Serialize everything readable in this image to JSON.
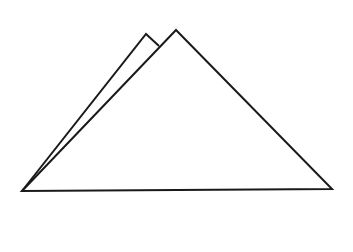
{
  "diagram": {
    "background": "#ffffff",
    "stroke_color": "#1a1a1a",
    "stroke_width": 2,
    "shapes": [
      {
        "name": "back-triangle",
        "points": [
          [
            22,
            191
          ],
          [
            146,
            34
          ],
          [
            159,
            46
          ]
        ]
      },
      {
        "name": "front-triangle",
        "points": [
          [
            22,
            191
          ],
          [
            176,
            30
          ],
          [
            332,
            189
          ]
        ]
      }
    ]
  }
}
